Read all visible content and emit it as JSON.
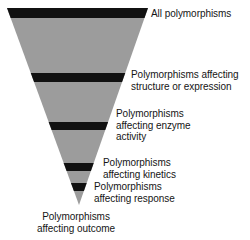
{
  "diagram": {
    "type": "inverted-funnel",
    "background_color": "#ffffff",
    "funnel_fill_color": "#9c9c9c",
    "band_color": "#111111",
    "text_color": "#151515",
    "geometry": {
      "top_left_x": 7,
      "top_right_x": 148,
      "top_y": 8,
      "tip_x": 79,
      "tip_y": 205
    },
    "bands": [
      {
        "name": "band-top",
        "y_top": 8,
        "y_bottom": 18
      },
      {
        "name": "band-structure-expression",
        "y_top": 73,
        "y_bottom": 82
      },
      {
        "name": "band-enzyme-activity",
        "y_top": 122,
        "y_bottom": 130
      },
      {
        "name": "band-kinetics",
        "y_top": 163,
        "y_bottom": 171
      },
      {
        "name": "band-response",
        "y_top": 183,
        "y_bottom": 191
      }
    ],
    "labels": {
      "all_polymorphisms": "All polymorphisms",
      "structure_expression": "Polymorphisms affecting\nstructure or expression",
      "enzyme_activity": "Polymorphisms\naffecting enzyme\nactivity",
      "kinetics": "Polymorphisms\naffecting kinetics",
      "response": "Polymorphisms\naffecting response",
      "outcome": "Polymorphisms\naffecting outcome"
    }
  }
}
